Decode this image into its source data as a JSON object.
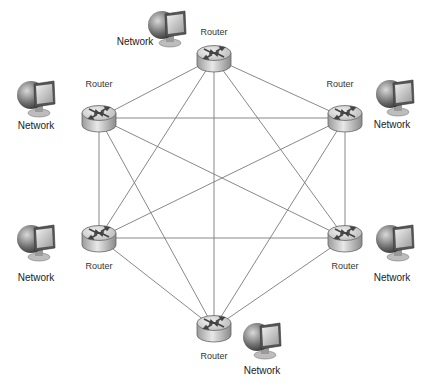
{
  "diagram": {
    "type": "full-mesh-network",
    "colors": {
      "link": "#7a7a7a",
      "router_body": "#c9c9c9",
      "router_top": "#e6e6e6",
      "text": "#333333"
    },
    "routers": [
      {
        "id": "top",
        "label": "Router",
        "x": 214,
        "y": 58,
        "label_x": 214,
        "label_y": 32
      },
      {
        "id": "upper-left",
        "label": "Router",
        "x": 99,
        "y": 118,
        "label_x": 99,
        "label_y": 84
      },
      {
        "id": "upper-right",
        "label": "Router",
        "x": 345,
        "y": 118,
        "label_x": 340,
        "label_y": 84
      },
      {
        "id": "lower-left",
        "label": "Router",
        "x": 99,
        "y": 238,
        "label_x": 99,
        "label_y": 266
      },
      {
        "id": "lower-right",
        "label": "Router",
        "x": 345,
        "y": 238,
        "label_x": 345,
        "label_y": 266
      },
      {
        "id": "bottom",
        "label": "Router",
        "x": 214,
        "y": 328,
        "label_x": 214,
        "label_y": 356
      }
    ],
    "networks": [
      {
        "id": "net-top",
        "label": "Network",
        "x": 167,
        "y": 28,
        "label_x": 135,
        "label_y": 42
      },
      {
        "id": "net-upper-left",
        "label": "Network",
        "x": 36,
        "y": 98,
        "label_x": 36,
        "label_y": 126
      },
      {
        "id": "net-upper-right",
        "label": "Network",
        "x": 395,
        "y": 97,
        "label_x": 392,
        "label_y": 125
      },
      {
        "id": "net-lower-left",
        "label": "Network",
        "x": 36,
        "y": 242,
        "label_x": 36,
        "label_y": 278
      },
      {
        "id": "net-lower-right",
        "label": "Network",
        "x": 395,
        "y": 242,
        "label_x": 392,
        "label_y": 278
      },
      {
        "id": "net-bottom",
        "label": "Network",
        "x": 262,
        "y": 340,
        "label_x": 262,
        "label_y": 371
      }
    ],
    "links": [
      [
        "top",
        "upper-left"
      ],
      [
        "top",
        "upper-right"
      ],
      [
        "top",
        "lower-left"
      ],
      [
        "top",
        "lower-right"
      ],
      [
        "top",
        "bottom"
      ],
      [
        "upper-left",
        "upper-right"
      ],
      [
        "upper-left",
        "lower-left"
      ],
      [
        "upper-left",
        "lower-right"
      ],
      [
        "upper-left",
        "bottom"
      ],
      [
        "upper-right",
        "lower-left"
      ],
      [
        "upper-right",
        "lower-right"
      ],
      [
        "upper-right",
        "bottom"
      ],
      [
        "lower-left",
        "lower-right"
      ],
      [
        "lower-left",
        "bottom"
      ],
      [
        "lower-right",
        "bottom"
      ]
    ]
  }
}
